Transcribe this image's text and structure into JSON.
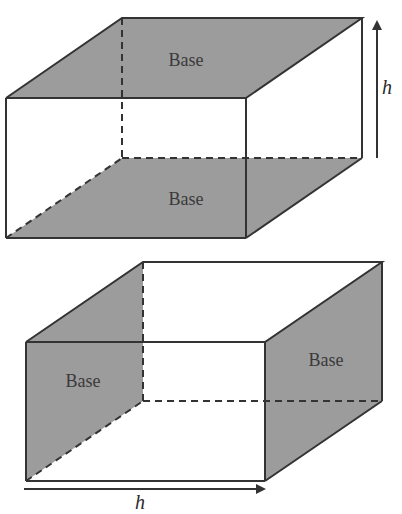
{
  "figure": {
    "colors": {
      "base_fill": "#9c9c9c",
      "edge": "#333333",
      "background": "#ffffff"
    },
    "top_prism": {
      "base_top_label": "Base",
      "base_bottom_label": "Base",
      "height_label": "h",
      "height_direction": "vertical"
    },
    "bottom_prism": {
      "base_left_label": "Base",
      "base_right_label": "Base",
      "height_label": "h",
      "height_direction": "horizontal"
    }
  }
}
